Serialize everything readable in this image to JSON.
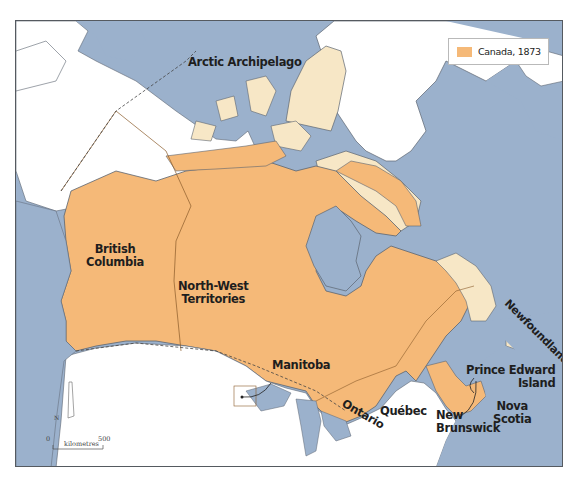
{
  "map": {
    "title_legend": {
      "label": "Canada, 1873",
      "swatch_color": "#f5b978"
    },
    "colors": {
      "water": "#9bb1cc",
      "canada_1873": "#f5b978",
      "other_british_territory": "#f7e7c6",
      "foreign_land": "#ffffff",
      "border_line": "#8a5a2a",
      "coastline": "#5c6470"
    },
    "labels": {
      "arctic": "Arctic Archipelago",
      "bc_line1": "British",
      "bc_line2": "Columbia",
      "nwt_line1": "North-West",
      "nwt_line2": "Territories",
      "manitoba": "Manitoba",
      "ontario": "Ontario",
      "quebec": "Québec",
      "newfoundland": "Newfoundland",
      "pei_line1": "Prince Edward",
      "pei_line2": "Island",
      "ns_line1": "Nova",
      "ns_line2": "Scotia",
      "nb_line1": "New",
      "nb_line2": "Brunswick"
    },
    "scale_bar": {
      "start": "0",
      "end": "500",
      "unit": "kilometres",
      "north_arrow": "N"
    }
  }
}
